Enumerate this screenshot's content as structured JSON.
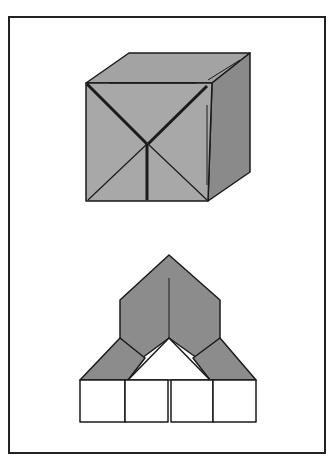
{
  "diagram": {
    "type": "origami-fold-illustration",
    "figures": [
      {
        "name": "folded-cube",
        "description": "Isometric cube with X creases on front face"
      },
      {
        "name": "unfolded-base",
        "description": "Pointed roof shape over four square flaps"
      }
    ],
    "colors": {
      "face_front": "#a6a6a6",
      "face_top": "#9e9e9e",
      "face_side": "#8a8a8a",
      "roof": "#8c8c8c",
      "flap": "#ffffff",
      "line": "#1a1a1a"
    }
  }
}
